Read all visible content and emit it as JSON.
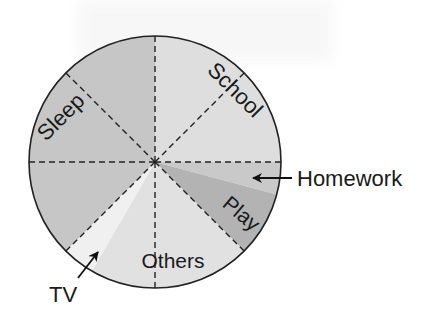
{
  "chart_data": {
    "type": "pie",
    "title": "",
    "unit": "hours per day",
    "total": 24,
    "categories": [
      "School",
      "Homework",
      "Play",
      "Others",
      "TV",
      "Sleep"
    ],
    "values": [
      6,
      1,
      2,
      5,
      1,
      9
    ],
    "slices": [
      {
        "label": "School",
        "hours": 6,
        "start_deg": 0,
        "end_deg": 90,
        "color": "#dedede"
      },
      {
        "label": "Homework",
        "hours": 1,
        "start_deg": -15,
        "end_deg": 0,
        "color": "#c9c9c9"
      },
      {
        "label": "Play",
        "hours": 2,
        "start_deg": -45,
        "end_deg": -15,
        "color": "#b3b3b3"
      },
      {
        "label": "Others",
        "hours": 5,
        "start_deg": -120,
        "end_deg": -45,
        "color": "#e1e1e1"
      },
      {
        "label": "TV",
        "hours": 1,
        "start_deg": -135,
        "end_deg": -120,
        "color": "#f0f0f0"
      },
      {
        "label": "Sleep",
        "hours": 9,
        "start_deg": 90,
        "end_deg": 225,
        "color": "#c6c6c6"
      }
    ],
    "dashed_divisions": 8,
    "legend": "none (inline labels and callout arrows)",
    "callouts": [
      {
        "label": "Homework",
        "side": "right"
      },
      {
        "label": "TV",
        "side": "bottom-left"
      }
    ]
  },
  "labels": {
    "sleep": "Sleep",
    "school": "School",
    "play": "Play",
    "others": "Others",
    "homework": "Homework",
    "tv": "TV"
  }
}
